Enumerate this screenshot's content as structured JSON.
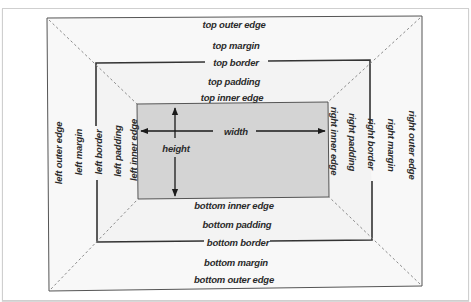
{
  "diagram": {
    "colors": {
      "content_fill": "#d4d4d4",
      "padding_fill": "#f3f3f3",
      "margin_fill": "#f8f8f8",
      "border_line": "#333333",
      "outer_line": "#555555",
      "dashed_line": "#8a8a8a"
    },
    "labels": {
      "top": {
        "outer_edge": "top outer edge",
        "margin": "top margin",
        "border": "top border",
        "padding": "top padding",
        "inner_edge": "top inner edge"
      },
      "bottom": {
        "inner_edge": "bottom inner edge",
        "padding": "bottom padding",
        "border": "bottom border",
        "margin": "bottom margin",
        "outer_edge": "bottom outer edge"
      },
      "left": {
        "outer_edge": "left outer edge",
        "margin": "left margin",
        "border": "left border",
        "padding": "left padding",
        "inner_edge": "left inner edge"
      },
      "right": {
        "inner_edge": "right inner edge",
        "padding": "right padding",
        "border": "right border",
        "margin": "right margin",
        "outer_edge": "right outer edge"
      },
      "content": {
        "width": "width",
        "height": "height"
      }
    }
  }
}
